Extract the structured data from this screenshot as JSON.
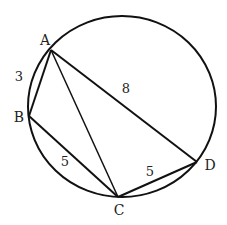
{
  "diagram": {
    "type": "cyclic-quadrilateral-in-circle",
    "circle": {
      "cx": 122,
      "cy": 106.5,
      "rx": 94,
      "ry": 90.5
    },
    "points": {
      "A": {
        "label": "A",
        "x": 51,
        "y": 50,
        "lx": 45,
        "ly": 45
      },
      "B": {
        "label": "B",
        "x": 29,
        "y": 116,
        "lx": 19,
        "ly": 122
      },
      "C": {
        "label": "C",
        "x": 118,
        "y": 197,
        "lx": 119,
        "ly": 215
      },
      "D": {
        "label": "D",
        "x": 197,
        "y": 162,
        "lx": 210,
        "ly": 170
      }
    },
    "segments": [
      {
        "from": "A",
        "to": "B",
        "length_label": "3",
        "lx": 19,
        "ly": 81
      },
      {
        "from": "A",
        "to": "D",
        "length_label": "8",
        "lx": 126,
        "ly": 93
      },
      {
        "from": "B",
        "to": "C",
        "length_label": "5",
        "lx": 65,
        "ly": 166
      },
      {
        "from": "C",
        "to": "D",
        "length_label": "5",
        "lx": 150,
        "ly": 176
      },
      {
        "from": "A",
        "to": "C",
        "length_label": ""
      }
    ],
    "stroke_color": "#111111"
  }
}
